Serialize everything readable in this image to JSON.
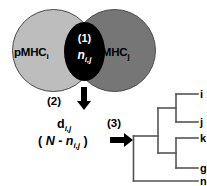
{
  "venn": {
    "left_circle_label": "pMHC",
    "left_circle_subscript": "i",
    "right_circle_label": "pMHC",
    "right_circle_subscript": "j",
    "overlap_step": "(1)",
    "overlap_variable": "n",
    "overlap_variable_subscript": "i,j",
    "left_color": "#bdbdbd",
    "right_color": "#767676",
    "overlap_color": "#000000"
  },
  "steps": {
    "step2": "(2)",
    "step3": "(3)"
  },
  "formula": {
    "distance_symbol": "d",
    "distance_subscript": "i,j",
    "expression_open": "( ",
    "expression_N": "N",
    "expression_minus": " - ",
    "expression_n": "n",
    "expression_n_subscript": "i,j",
    "expression_close": " )"
  },
  "dendrogram": {
    "leaves": [
      {
        "label": "i"
      },
      {
        "label": "j"
      },
      {
        "label": "k"
      },
      {
        "label": "g"
      },
      {
        "label": "n"
      }
    ],
    "line_color": "#555555"
  }
}
